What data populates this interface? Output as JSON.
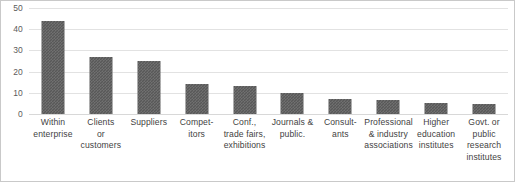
{
  "chart_data": {
    "type": "bar",
    "title": "",
    "subtitle": "",
    "xlabel": "",
    "ylabel": "",
    "ylim": [
      0,
      50
    ],
    "ytick_step": 10,
    "yticks": [
      "50",
      "40",
      "30",
      "20",
      "10",
      "0"
    ],
    "grid": true,
    "legend": false,
    "legend_position": "none",
    "bar_color": "#585858",
    "gridline_color": "#e2e2e2",
    "categories": [
      "Within enterprise",
      "Clients or customers",
      "Suppliers",
      "Competitors",
      "Conf., trade fairs, exhibitions",
      "Journals & public.",
      "Consultants",
      "Professional & industry associations",
      "Higher education institutes",
      "Govt. or public research institutes"
    ],
    "category_label_lines": [
      [
        "Within",
        "enterprise"
      ],
      [
        "Clients",
        "or",
        "customers"
      ],
      [
        "Suppliers"
      ],
      [
        "Compet-",
        "itors"
      ],
      [
        "Conf.,",
        "trade fairs,",
        "exhibitions"
      ],
      [
        "Journals &",
        "public."
      ],
      [
        "Consult-",
        "ants"
      ],
      [
        "Professional",
        "& industry",
        "associations"
      ],
      [
        "Higher",
        "education",
        "institutes"
      ],
      [
        "Govt. or",
        "public",
        "research",
        "institutes"
      ]
    ],
    "values": [
      44,
      27,
      25,
      14,
      13,
      10,
      7,
      6.5,
      5,
      4.5
    ]
  }
}
